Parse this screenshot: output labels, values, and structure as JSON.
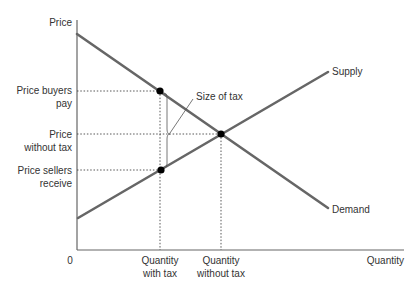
{
  "diagram": {
    "axes": {
      "y_label": "Price",
      "x_label": "Quantity",
      "origin_label": "0"
    },
    "price_labels": {
      "buyers_pay": [
        "Price buyers",
        "pay"
      ],
      "without_tax": [
        "Price",
        "without tax"
      ],
      "sellers_receive": [
        "Price sellers",
        "receive"
      ]
    },
    "quantity_labels": {
      "with_tax": [
        "Quantity",
        "with tax"
      ],
      "without_tax": [
        "Quantity",
        "without tax"
      ]
    },
    "curves": {
      "supply": "Supply",
      "demand": "Demand"
    },
    "annotation": {
      "size_of_tax": "Size of tax"
    },
    "colors": {
      "curve": "#666666",
      "axis": "#555555",
      "guide": "#444444",
      "point": "#000000",
      "text": "#333333"
    }
  }
}
